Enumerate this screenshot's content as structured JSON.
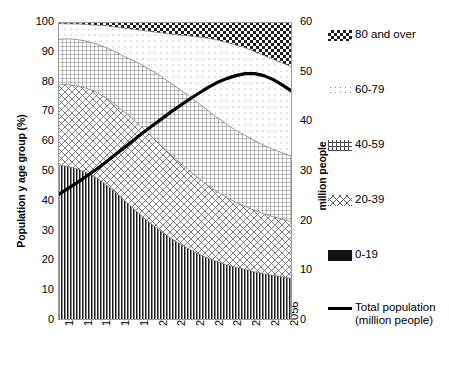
{
  "chart_data": {
    "type": "area",
    "title": "",
    "subtitle": "",
    "xlabel": "",
    "ylabel": "Population y age group (%)",
    "y2label": "million people",
    "xlim": [
      1960,
      2060
    ],
    "ylim": [
      0,
      100
    ],
    "y2lim": [
      0,
      60
    ],
    "grid": true,
    "legend_position": "right",
    "y_ticks": [
      0,
      10,
      20,
      30,
      40,
      50,
      60,
      70,
      80,
      90,
      100
    ],
    "y2_ticks": [
      0,
      10,
      20,
      30,
      40,
      50,
      60
    ],
    "x_tick_labels": [
      "1960",
      "1968",
      "1976",
      "1984",
      "1992",
      "2000",
      "2008",
      "2016",
      "2024",
      "2032",
      "2040",
      "2048",
      "2056"
    ],
    "x_tick_values": [
      1960,
      1968,
      1976,
      1984,
      1992,
      2000,
      2008,
      2016,
      2024,
      2032,
      2040,
      2048,
      2056
    ],
    "x": [
      1960,
      1964,
      1968,
      1972,
      1976,
      1980,
      1984,
      1988,
      1992,
      1996,
      2000,
      2004,
      2008,
      2012,
      2016,
      2020,
      2024,
      2028,
      2032,
      2036,
      2040,
      2044,
      2048,
      2052,
      2056,
      2060
    ],
    "series": [
      {
        "name": "0-19",
        "pattern": "vertical-lines",
        "values": [
          52.0,
          51.6,
          50.8,
          49.6,
          48.0,
          45.8,
          43.2,
          40.4,
          37.6,
          34.8,
          32.2,
          29.8,
          27.6,
          25.6,
          23.8,
          22.2,
          20.8,
          19.6,
          18.6,
          17.7,
          17.0,
          16.2,
          15.5,
          15.0,
          14.5,
          14.0
        ]
      },
      {
        "name": "20-39",
        "pattern": "diagonal-crosshatch",
        "values": [
          27.0,
          27.4,
          27.8,
          28.2,
          28.6,
          29.0,
          29.4,
          29.6,
          29.8,
          29.8,
          29.4,
          28.8,
          28.0,
          27.2,
          26.4,
          25.4,
          24.4,
          23.4,
          22.6,
          21.8,
          21.2,
          20.6,
          20.1,
          19.7,
          19.3,
          19.0
        ]
      },
      {
        "name": "40-59",
        "pattern": "grid-crosshatch",
        "values": [
          15.2,
          15.4,
          15.6,
          15.8,
          16.2,
          16.8,
          17.6,
          18.6,
          19.8,
          21.0,
          22.2,
          23.2,
          24.0,
          24.6,
          25.0,
          25.2,
          25.2,
          25.0,
          24.6,
          24.2,
          23.8,
          23.4,
          23.0,
          22.6,
          22.3,
          22.0
        ]
      },
      {
        "name": "60-79",
        "pattern": "sparse-dots",
        "values": [
          5.3,
          5.0,
          5.2,
          5.6,
          6.2,
          7.2,
          8.2,
          9.4,
          10.4,
          11.6,
          13.0,
          14.6,
          16.4,
          18.2,
          20.2,
          22.2,
          24.2,
          26.0,
          27.4,
          28.6,
          29.4,
          29.9,
          30.2,
          30.2,
          30.1,
          30.0
        ]
      },
      {
        "name": "80 and over",
        "pattern": "checkerboard",
        "values": [
          0.5,
          0.6,
          0.6,
          0.8,
          1.0,
          1.2,
          1.6,
          2.0,
          2.4,
          2.8,
          3.2,
          3.6,
          4.0,
          4.4,
          4.6,
          5.0,
          5.4,
          6.0,
          6.8,
          7.7,
          8.6,
          9.9,
          11.2,
          12.5,
          13.8,
          15.0
        ]
      }
    ],
    "line_series": {
      "name": "Total population (million people)",
      "axis": "right",
      "values_million": [
        25.2,
        26.4,
        27.6,
        28.9,
        30.2,
        31.6,
        33.1,
        34.6,
        36.1,
        37.6,
        39.0,
        40.4,
        41.8,
        43.1,
        44.4,
        45.6,
        46.8,
        47.8,
        48.6,
        49.2,
        49.6,
        49.6,
        49.2,
        48.4,
        47.3,
        46.0
      ],
      "peak_year": 2032,
      "peak_value_million": 52.0,
      "start_value_million": 25.0,
      "end_value_million": 44.5
    }
  },
  "legend": {
    "items": [
      {
        "label": "80 and over",
        "pattern": "checkerboard"
      },
      {
        "label": "60-79",
        "pattern": "sparse-dots"
      },
      {
        "label": "40-59",
        "pattern": "grid-crosshatch"
      },
      {
        "label": "20-39",
        "pattern": "diagonal-crosshatch"
      },
      {
        "label": "0-19",
        "pattern": "solid-black"
      }
    ],
    "line_entry": {
      "label": "Total population",
      "sublabel": "(million people)",
      "pattern": "solid-line"
    }
  },
  "colors": {
    "ink": "#000000",
    "axis": "#808080",
    "grid": "#bfbfbf",
    "fill_light": "#f2f2f2",
    "fill_mid": "#8c8c8c"
  }
}
